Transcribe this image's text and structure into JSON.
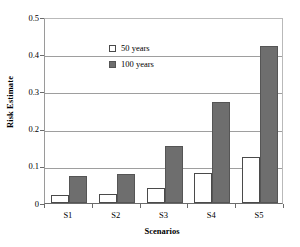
{
  "chart_data": {
    "type": "bar",
    "title": "",
    "xlabel": "Scenarios",
    "ylabel": "Risk Estimate",
    "categories": [
      "S1",
      "S2",
      "S3",
      "S4",
      "S5"
    ],
    "series": [
      {
        "name": "50 years",
        "values": [
          0.022,
          0.025,
          0.04,
          0.081,
          0.124
        ],
        "color": "#ffffff"
      },
      {
        "name": "100 years",
        "values": [
          0.073,
          0.078,
          0.153,
          0.272,
          0.422
        ],
        "color": "#6e6e6e"
      }
    ],
    "ylim": [
      0,
      0.5
    ],
    "yticks": [
      "0",
      "0.1",
      "0.2",
      "0.3",
      "0.4",
      "0.5"
    ],
    "ytick_values": [
      0,
      0.1,
      0.2,
      0.3,
      0.4,
      0.5
    ],
    "grid": "horizontal",
    "legend_position": "top-left"
  },
  "legend": {
    "entries": [
      {
        "label": "50 years",
        "marker": "open-square"
      },
      {
        "label": "100 years",
        "marker": "filled-square"
      }
    ]
  }
}
